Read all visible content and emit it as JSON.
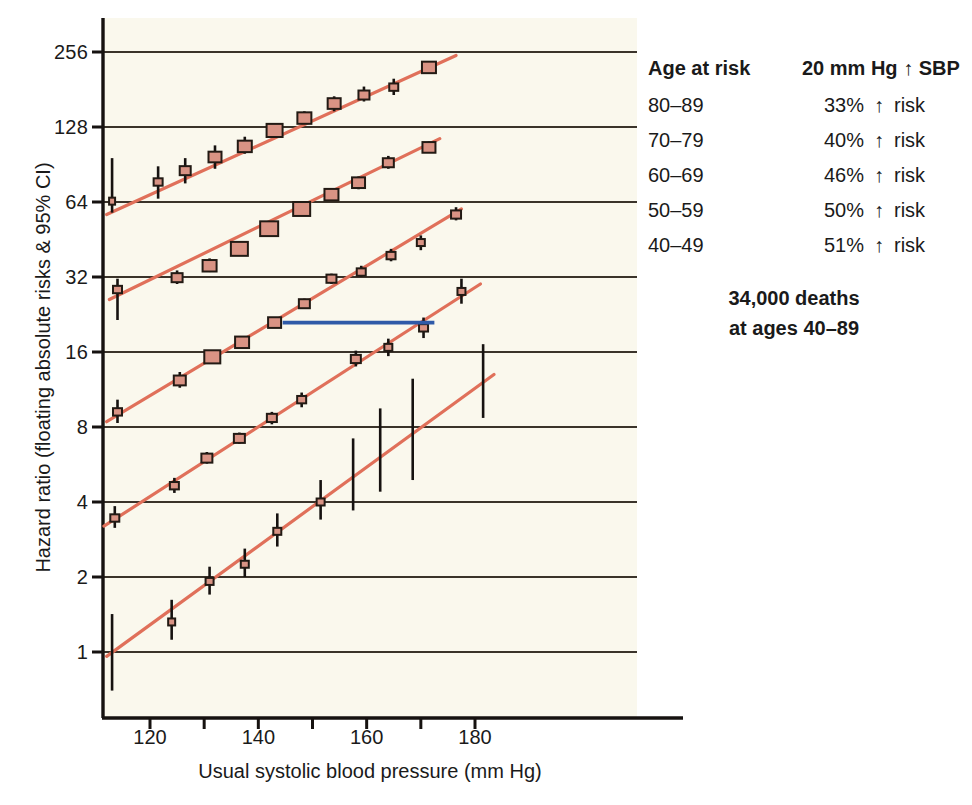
{
  "chart_data": {
    "type": "scatter",
    "title": "",
    "xlabel": "Usual systolic blood pressure (mm Hg)",
    "ylabel": "Hazard ratio (floating absolute risks & 95% CI)",
    "xlim": [
      110,
      188
    ],
    "ylim": [
      0.62,
      330
    ],
    "yscale": "log2",
    "xticks": [
      120,
      140,
      160,
      180
    ],
    "xtick_minor": [
      130,
      150,
      170
    ],
    "yticks": [
      1,
      2,
      4,
      8,
      16,
      32,
      64,
      128,
      256
    ],
    "ytick_labels": [
      "1",
      "2",
      "4",
      "8",
      "16",
      "32",
      "64",
      "128",
      "256"
    ],
    "grid": "horizontal",
    "legend_position": "right",
    "marker_color": "#d99384",
    "marker_edge_color": "#221a14",
    "trend_color": "#e0705a",
    "errorbar_color": "#161210",
    "reference_line_color": "#2f5aa8",
    "plot_background": "#faf8ed",
    "reference_line": {
      "y": 21.0,
      "x_start": 144.5,
      "x_end": 172.5
    },
    "series": [
      {
        "name": "80-89",
        "trend": {
          "x0": 112.0,
          "y0": 57.0,
          "x1": 176.5,
          "y1": 248.0
        },
        "points": [
          {
            "x": 113.0,
            "y": 64.5,
            "lo": 58.0,
            "hi": 96.0,
            "size": 6
          },
          {
            "x": 121.5,
            "y": 77.0,
            "lo": 66.0,
            "hi": 89.0,
            "size": 9
          },
          {
            "x": 126.5,
            "y": 85.5,
            "lo": 76.0,
            "hi": 96.0,
            "size": 11
          },
          {
            "x": 132.0,
            "y": 97.0,
            "lo": 87.0,
            "hi": 108.0,
            "size": 13
          },
          {
            "x": 137.5,
            "y": 107.0,
            "lo": 100.0,
            "hi": 117.0,
            "size": 14
          },
          {
            "x": 143.0,
            "y": 124.0,
            "lo": 119.0,
            "hi": 132.0,
            "size": 16
          },
          {
            "x": 148.5,
            "y": 139.0,
            "lo": 132.0,
            "hi": 148.0,
            "size": 14
          },
          {
            "x": 154.0,
            "y": 159.0,
            "lo": 148.0,
            "hi": 170.0,
            "size": 13
          },
          {
            "x": 159.5,
            "y": 172.0,
            "lo": 162.0,
            "hi": 186.0,
            "size": 11
          },
          {
            "x": 165.0,
            "y": 185.0,
            "lo": 172.0,
            "hi": 200.0,
            "size": 9
          },
          {
            "x": 171.5,
            "y": 222.0,
            "lo": 212.0,
            "hi": 232.0,
            "size": 14
          }
        ]
      },
      {
        "name": "70-79",
        "trend": {
          "x0": 112.5,
          "y0": 26.0,
          "x1": 173.5,
          "y1": 115.0
        },
        "points": [
          {
            "x": 114.0,
            "y": 28.5,
            "lo": 21.5,
            "hi": 31.5,
            "size": 9
          },
          {
            "x": 125.0,
            "y": 31.8,
            "lo": 30.0,
            "hi": 34.0,
            "size": 11
          },
          {
            "x": 131.0,
            "y": 35.5,
            "lo": 33.5,
            "hi": 38.0,
            "size": 14
          },
          {
            "x": 136.5,
            "y": 41.5,
            "lo": 40.0,
            "hi": 44.0,
            "size": 17
          },
          {
            "x": 142.0,
            "y": 50.0,
            "lo": 48.0,
            "hi": 52.5,
            "size": 18
          },
          {
            "x": 148.0,
            "y": 60.0,
            "lo": 57.0,
            "hi": 63.0,
            "size": 17
          },
          {
            "x": 153.5,
            "y": 68.5,
            "lo": 66.0,
            "hi": 72.0,
            "size": 14
          },
          {
            "x": 158.5,
            "y": 76.5,
            "lo": 72.0,
            "hi": 81.0,
            "size": 13
          },
          {
            "x": 164.0,
            "y": 92.0,
            "lo": 87.0,
            "hi": 98.0,
            "size": 11
          },
          {
            "x": 171.5,
            "y": 106.0,
            "lo": 102.0,
            "hi": 112.0,
            "size": 13
          }
        ]
      },
      {
        "name": "60-69",
        "trend": {
          "x0": 112.0,
          "y0": 8.4,
          "x1": 177.5,
          "y1": 60.0
        },
        "points": [
          {
            "x": 114.0,
            "y": 9.2,
            "lo": 8.3,
            "hi": 10.3,
            "size": 9
          },
          {
            "x": 125.5,
            "y": 12.3,
            "lo": 11.5,
            "hi": 13.3,
            "size": 12
          },
          {
            "x": 131.5,
            "y": 15.3,
            "lo": 14.5,
            "hi": 16.3,
            "size": 16
          },
          {
            "x": 137.0,
            "y": 17.5,
            "lo": 16.8,
            "hi": 18.4,
            "size": 14
          },
          {
            "x": 143.0,
            "y": 21.0,
            "lo": 20.2,
            "hi": 22.0,
            "size": 13
          },
          {
            "x": 148.5,
            "y": 25.0,
            "lo": 24.0,
            "hi": 26.2,
            "size": 11
          },
          {
            "x": 153.5,
            "y": 31.5,
            "lo": 30.0,
            "hi": 33.0,
            "size": 10
          },
          {
            "x": 159.0,
            "y": 33.5,
            "lo": 32.0,
            "hi": 35.5,
            "size": 9
          },
          {
            "x": 164.5,
            "y": 39.0,
            "lo": 37.0,
            "hi": 41.5,
            "size": 9
          },
          {
            "x": 170.0,
            "y": 44.0,
            "lo": 41.0,
            "hi": 47.0,
            "size": 8
          },
          {
            "x": 176.5,
            "y": 57.0,
            "lo": 54.0,
            "hi": 61.0,
            "size": 10
          }
        ]
      },
      {
        "name": "50-59",
        "trend": {
          "x0": 111.5,
          "y0": 3.2,
          "x1": 181.0,
          "y1": 30.0
        },
        "points": [
          {
            "x": 113.5,
            "y": 3.45,
            "lo": 3.15,
            "hi": 3.85,
            "size": 9
          },
          {
            "x": 124.5,
            "y": 4.65,
            "lo": 4.35,
            "hi": 5.0,
            "size": 9
          },
          {
            "x": 130.5,
            "y": 6.0,
            "lo": 5.7,
            "hi": 6.35,
            "size": 11
          },
          {
            "x": 136.5,
            "y": 7.2,
            "lo": 6.85,
            "hi": 7.6,
            "size": 11
          },
          {
            "x": 142.5,
            "y": 8.7,
            "lo": 8.2,
            "hi": 9.2,
            "size": 10
          },
          {
            "x": 148.0,
            "y": 10.3,
            "lo": 9.6,
            "hi": 11.0,
            "size": 9
          },
          {
            "x": 158.0,
            "y": 15.0,
            "lo": 14.0,
            "hi": 16.2,
            "size": 10
          },
          {
            "x": 164.0,
            "y": 16.7,
            "lo": 15.4,
            "hi": 18.1,
            "size": 8
          },
          {
            "x": 170.5,
            "y": 20.0,
            "lo": 18.2,
            "hi": 22.0,
            "size": 9
          },
          {
            "x": 177.5,
            "y": 28.0,
            "lo": 25.0,
            "hi": 31.5,
            "size": 8
          }
        ]
      },
      {
        "name": "40-49",
        "trend": {
          "x0": 112.0,
          "y0": 0.96,
          "x1": 183.5,
          "y1": 13.0
        },
        "points": [
          {
            "x": 113.0,
            "y": 0.98,
            "lo": 0.7,
            "hi": 1.42,
            "size": 0
          },
          {
            "x": 124.0,
            "y": 1.32,
            "lo": 1.12,
            "hi": 1.62,
            "size": 7
          },
          {
            "x": 131.0,
            "y": 1.92,
            "lo": 1.7,
            "hi": 2.2,
            "size": 8
          },
          {
            "x": 137.5,
            "y": 2.25,
            "lo": 2.0,
            "hi": 2.6,
            "size": 8
          },
          {
            "x": 143.5,
            "y": 3.05,
            "lo": 2.65,
            "hi": 3.6,
            "size": 8
          },
          {
            "x": 151.5,
            "y": 4.0,
            "lo": 3.4,
            "hi": 4.9,
            "size": 8
          },
          {
            "x": 157.5,
            "y": 5.0,
            "lo": 3.7,
            "hi": 7.2,
            "size": 0
          },
          {
            "x": 162.5,
            "y": 6.0,
            "lo": 4.4,
            "hi": 9.5,
            "size": 0
          },
          {
            "x": 168.5,
            "y": 8.0,
            "lo": 4.9,
            "hi": 12.5,
            "size": 0
          },
          {
            "x": 181.5,
            "y": 11.5,
            "lo": 8.7,
            "hi": 17.2,
            "size": 0
          }
        ]
      }
    ]
  },
  "legend": {
    "headers": {
      "age": "Age at risk",
      "effect": "20 mm Hg ↑ SBP"
    },
    "rows": [
      {
        "age": "80–89",
        "value": "33%",
        "arrow": "↑",
        "risk": "risk"
      },
      {
        "age": "70–79",
        "value": "40%",
        "arrow": "↑",
        "risk": "risk"
      },
      {
        "age": "60–69",
        "value": "46%",
        "arrow": "↑",
        "risk": "risk"
      },
      {
        "age": "50–59",
        "value": "50%",
        "arrow": "↑",
        "risk": "risk"
      },
      {
        "age": "40–49",
        "value": "51%",
        "arrow": "↑",
        "risk": "risk"
      }
    ],
    "footer_line1": "34,000 deaths",
    "footer_line2": "at ages 40–89"
  }
}
